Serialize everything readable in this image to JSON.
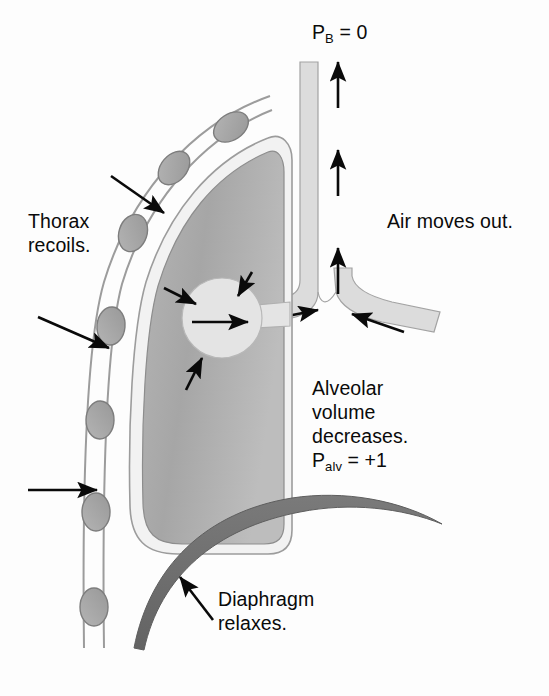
{
  "figure": {
    "width": 549,
    "height": 696,
    "background": "#fdfdfd"
  },
  "labels": {
    "barometric_pressure": {
      "symbol": "P",
      "subscript": "B",
      "equation": " = 0",
      "full_text": "PB = 0"
    },
    "thorax": {
      "line1": "Thorax",
      "line2": "recoils."
    },
    "air_flow": {
      "text": "Air moves out."
    },
    "alveolar": {
      "line1": "Alveolar",
      "line2": "volume",
      "line3": "decreases."
    },
    "alveolar_pressure": {
      "symbol": "P",
      "subscript": "alv",
      "equation": " = +1",
      "full_text": "Palv = +1"
    },
    "diaphragm": {
      "line1": "Diaphragm",
      "line2": "relaxes."
    }
  },
  "colors": {
    "lung_fill": "#a9a9a9",
    "lung_fill_light": "#c2c2c2",
    "pleura_line": "#8f8f8f",
    "airway_fill": "#dcdcdc",
    "airway_stroke": "#a0a0a0",
    "alveolus_fill": "#e4e4e4",
    "rib_fill": "#a6a6a6",
    "rib_stroke": "#7d7d7d",
    "diaphragm_fill": "#6e6e6e",
    "chest_wall_line": "#9a9a9a",
    "arrow_black": "#0a0a0a",
    "text": "#0a0a0a",
    "background": "#fdfdfd"
  },
  "anatomy": {
    "structures": [
      {
        "name": "trachea",
        "description": "vertical airway column",
        "airflow": "upward, out"
      },
      {
        "name": "bronchus-left",
        "description": "branch to lung",
        "airflow": "toward trachea"
      },
      {
        "name": "bronchus-right",
        "description": "branch off-figure",
        "airflow": "toward trachea"
      },
      {
        "name": "lung",
        "description": "recoiling lung, reduced volume"
      },
      {
        "name": "alveolus",
        "description": "compressed alveolar sac"
      },
      {
        "name": "diaphragm",
        "description": "relaxed dome-shaped muscle, moves upward"
      },
      {
        "name": "thoracic-wall",
        "description": "chest wall with rib cross-sections"
      }
    ],
    "rib_count": 7,
    "trachea_arrow_count": 3,
    "thorax_arrow_count": 3,
    "alveolus_compression_arrow_count": 3
  }
}
